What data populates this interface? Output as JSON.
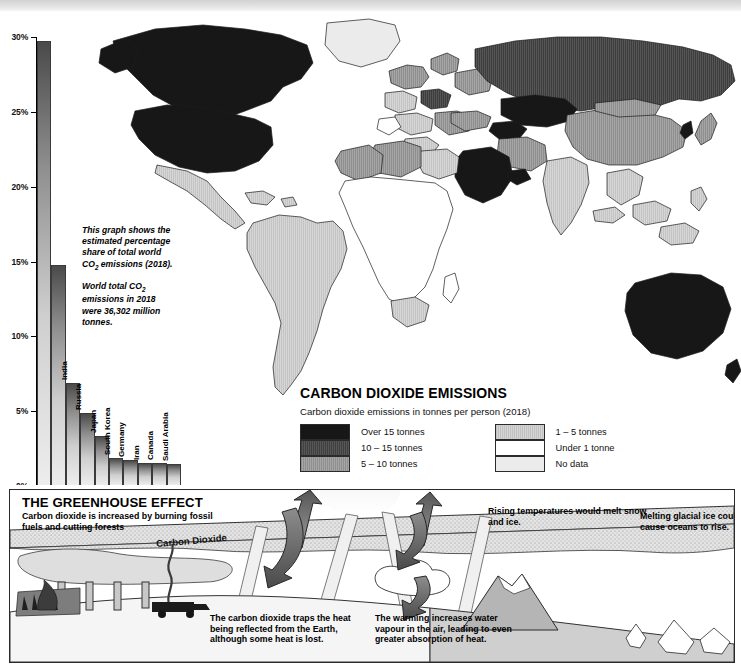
{
  "chart_data": {
    "type": "bar",
    "title": "Estimated percentage share of total world CO2 emissions (2018)",
    "xlabel": "",
    "ylabel": "",
    "ylim": [
      0,
      30
    ],
    "ytick_labels": [
      "0%",
      "5%",
      "10%",
      "15%",
      "20%",
      "25%",
      "30%"
    ],
    "ytick_values": [
      0,
      5,
      10,
      15,
      20,
      25,
      30
    ],
    "grid": false,
    "legend_position": "none",
    "categories": [
      "China",
      "USA",
      "India",
      "Russia",
      "Japan",
      "South Korea",
      "Germany",
      "Iran",
      "Canada",
      "Saudi Arabia"
    ],
    "values": [
      29.7,
      14.7,
      6.8,
      4.8,
      3.3,
      1.8,
      1.7,
      1.5,
      1.5,
      1.4
    ]
  },
  "caption": {
    "para1_a": "This graph shows the estimated percentage share of total world CO",
    "para1_sub": "2",
    "para1_b": " emissions (2018).",
    "para2_a": "World total CO",
    "para2_sub": "2",
    "para2_b": " emissions in 2018 were 36,302 million tonnes."
  },
  "legend": {
    "title": "CARBON DIOXIDE EMISSIONS",
    "subtitle": "Carbon dioxide emissions in tonnes per person (2018)",
    "column_left": [
      {
        "label": "Over 15 tonnes",
        "swatch": "sw-over15",
        "color": "#171717"
      },
      {
        "label": "10 – 15 tonnes",
        "swatch": "sw-10-15",
        "color": "#4d4d4d"
      },
      {
        "label": "5 – 10 tonnes",
        "swatch": "sw-5-10",
        "color": "#9a9a9a"
      }
    ],
    "column_right": [
      {
        "label": "1 – 5 tonnes",
        "swatch": "sw-1-5",
        "color": "#cbcbcb"
      },
      {
        "label": "Under 1 tonne",
        "swatch": "sw-under1",
        "color": "#ffffff"
      },
      {
        "label": "No data",
        "swatch": "sw-nodata",
        "color": "#ebebeb"
      }
    ]
  },
  "greenhouse": {
    "title": "THE GREENHOUSE EFFECT",
    "intro": "Carbon dioxide is increased by burning fossil fuels and cutting forests",
    "co2_label": "Carbon Dioxide",
    "note_traps": "The carbon dioxide traps the heat being reflected from the Earth, although some heat is lost.",
    "note_vapour": "The warming increases water vapour in the air, leading to even greater absorption of heat.",
    "note_melt": "Rising temperatures would melt snow and ice.",
    "note_oceans": "Melting glacial ice could cause oceans to rise."
  }
}
